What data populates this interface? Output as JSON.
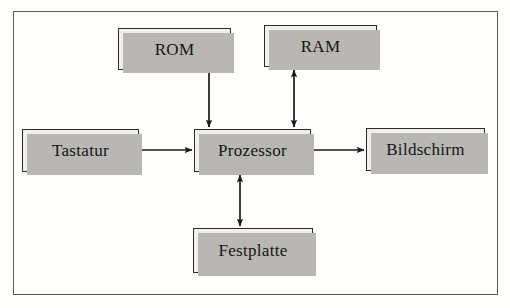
{
  "figure": {
    "language": "de",
    "frame": {
      "label": "diagram-frame"
    }
  },
  "nodes": [
    {
      "id": "rom",
      "label": "ROM"
    },
    {
      "id": "ram",
      "label": "RAM"
    },
    {
      "id": "tastatur",
      "label": "Tastatur"
    },
    {
      "id": "prozessor",
      "label": "Prozessor"
    },
    {
      "id": "bildschirm",
      "label": "Bildschirm"
    },
    {
      "id": "festplatte",
      "label": "Festplatte"
    }
  ],
  "edges": [
    {
      "id": "rom-prozessor",
      "from": "ROM",
      "to": "Prozessor",
      "direction": "one-way",
      "orientation": "vertical"
    },
    {
      "id": "ram-prozessor",
      "from": "RAM",
      "to": "Prozessor",
      "direction": "two-way",
      "orientation": "vertical"
    },
    {
      "id": "tastatur-prozessor",
      "from": "Tastatur",
      "to": "Prozessor",
      "direction": "one-way",
      "orientation": "horizontal"
    },
    {
      "id": "prozessor-bildschirm",
      "from": "Prozessor",
      "to": "Bildschirm",
      "direction": "one-way",
      "orientation": "horizontal"
    },
    {
      "id": "prozessor-festplatte",
      "from": "Prozessor",
      "to": "Festplatte",
      "direction": "two-way",
      "orientation": "vertical"
    }
  ],
  "colors": {
    "page_background": "#fdfdfc",
    "frame_border": "#5a5a5a",
    "node_fill": "#f1f0ee",
    "node_border": "#2b2b2b",
    "node_shadow": "#b9b7b4",
    "connector": "#1a1a1a",
    "text": "#151515"
  }
}
